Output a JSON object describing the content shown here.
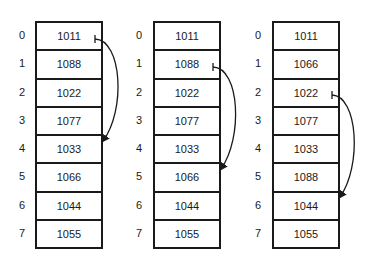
{
  "arrays": [
    {
      "indices": [
        "0",
        "1",
        "2",
        "3",
        "4",
        "5",
        "6",
        "7"
      ],
      "values": [
        "1011",
        "1088",
        "1022",
        "1077",
        "1033",
        "1066",
        "1044",
        "1055"
      ],
      "arrow": {
        "from_index": 0,
        "to_index": 4
      }
    },
    {
      "indices": [
        "0",
        "1",
        "2",
        "3",
        "4",
        "5",
        "6",
        "7"
      ],
      "values": [
        "1011",
        "1088",
        "1022",
        "1077",
        "1033",
        "1066",
        "1044",
        "1055"
      ],
      "arrow": {
        "from_index": 1,
        "to_index": 5
      }
    },
    {
      "indices": [
        "0",
        "1",
        "2",
        "3",
        "4",
        "5",
        "6",
        "7"
      ],
      "values": [
        "1011",
        "1066",
        "1022",
        "1077",
        "1033",
        "1088",
        "1044",
        "1055"
      ],
      "arrow": {
        "from_index": 2,
        "to_index": 6
      }
    }
  ]
}
